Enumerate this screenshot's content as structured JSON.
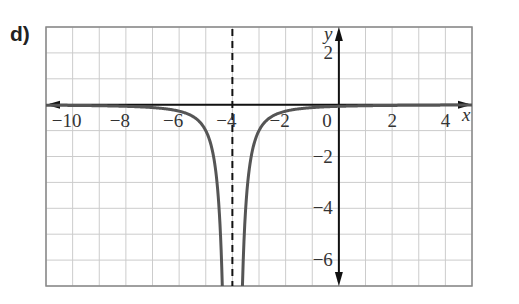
{
  "part_label": "d)",
  "chart_data": {
    "type": "line",
    "title": "",
    "xlabel": "x",
    "ylabel": "y",
    "xlim": [
      -11,
      5
    ],
    "ylim": [
      -7,
      3
    ],
    "grid": true,
    "x_tick_labels": [
      "−10",
      "−8",
      "−6",
      "−4",
      "−2",
      "0",
      "2",
      "4"
    ],
    "x_ticks": [
      -10,
      -8,
      -6,
      -4,
      -2,
      0,
      2,
      4
    ],
    "y_tick_labels": [
      "2",
      "−2",
      "−4",
      "−6"
    ],
    "y_ticks": [
      2,
      -2,
      -4,
      -6
    ],
    "asymptotes": [
      {
        "type": "vertical",
        "x": -4,
        "style": "dashed"
      },
      {
        "type": "horizontal",
        "y": 0
      }
    ],
    "series": [
      {
        "name": "y = -1/(x+4)^2",
        "description": "Curve approaching y=0 from below at both ends, dropping to -infinity near x=-4",
        "points": [
          [
            -11,
            -0.02
          ],
          [
            -8,
            -0.06
          ],
          [
            -6,
            -0.25
          ],
          [
            -5,
            -1
          ],
          [
            -4.6,
            -2.8
          ],
          [
            -4.4,
            -6.25
          ],
          [
            -3.6,
            -6.25
          ],
          [
            -3.4,
            -2.8
          ],
          [
            -3,
            -1
          ],
          [
            -2,
            -0.25
          ],
          [
            0,
            -0.06
          ],
          [
            5,
            -0.01
          ]
        ]
      }
    ],
    "colors": {
      "curve": "#555555",
      "axes": "#111111",
      "grid": "#cccccc",
      "asymptote": "#111111"
    }
  }
}
